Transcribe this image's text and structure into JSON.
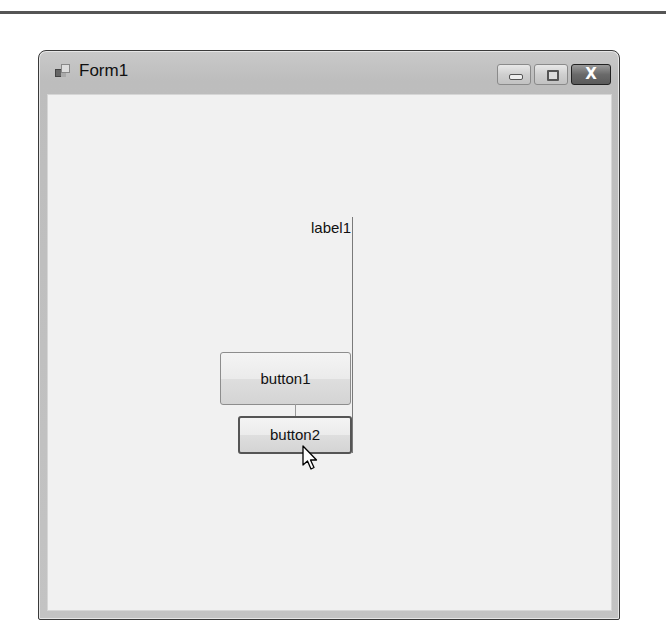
{
  "window": {
    "title": "Form1",
    "icon": "form-app-icon",
    "caption_buttons": [
      {
        "name": "minimize",
        "icon": "minimize-icon"
      },
      {
        "name": "maximize",
        "icon": "maximize-icon"
      },
      {
        "name": "close",
        "icon": "close-icon",
        "glyph": "X"
      }
    ]
  },
  "form": {
    "label1": "label1",
    "button1": "button1",
    "button2": "button2"
  },
  "cursor": {
    "icon": "arrow-cursor-icon"
  }
}
